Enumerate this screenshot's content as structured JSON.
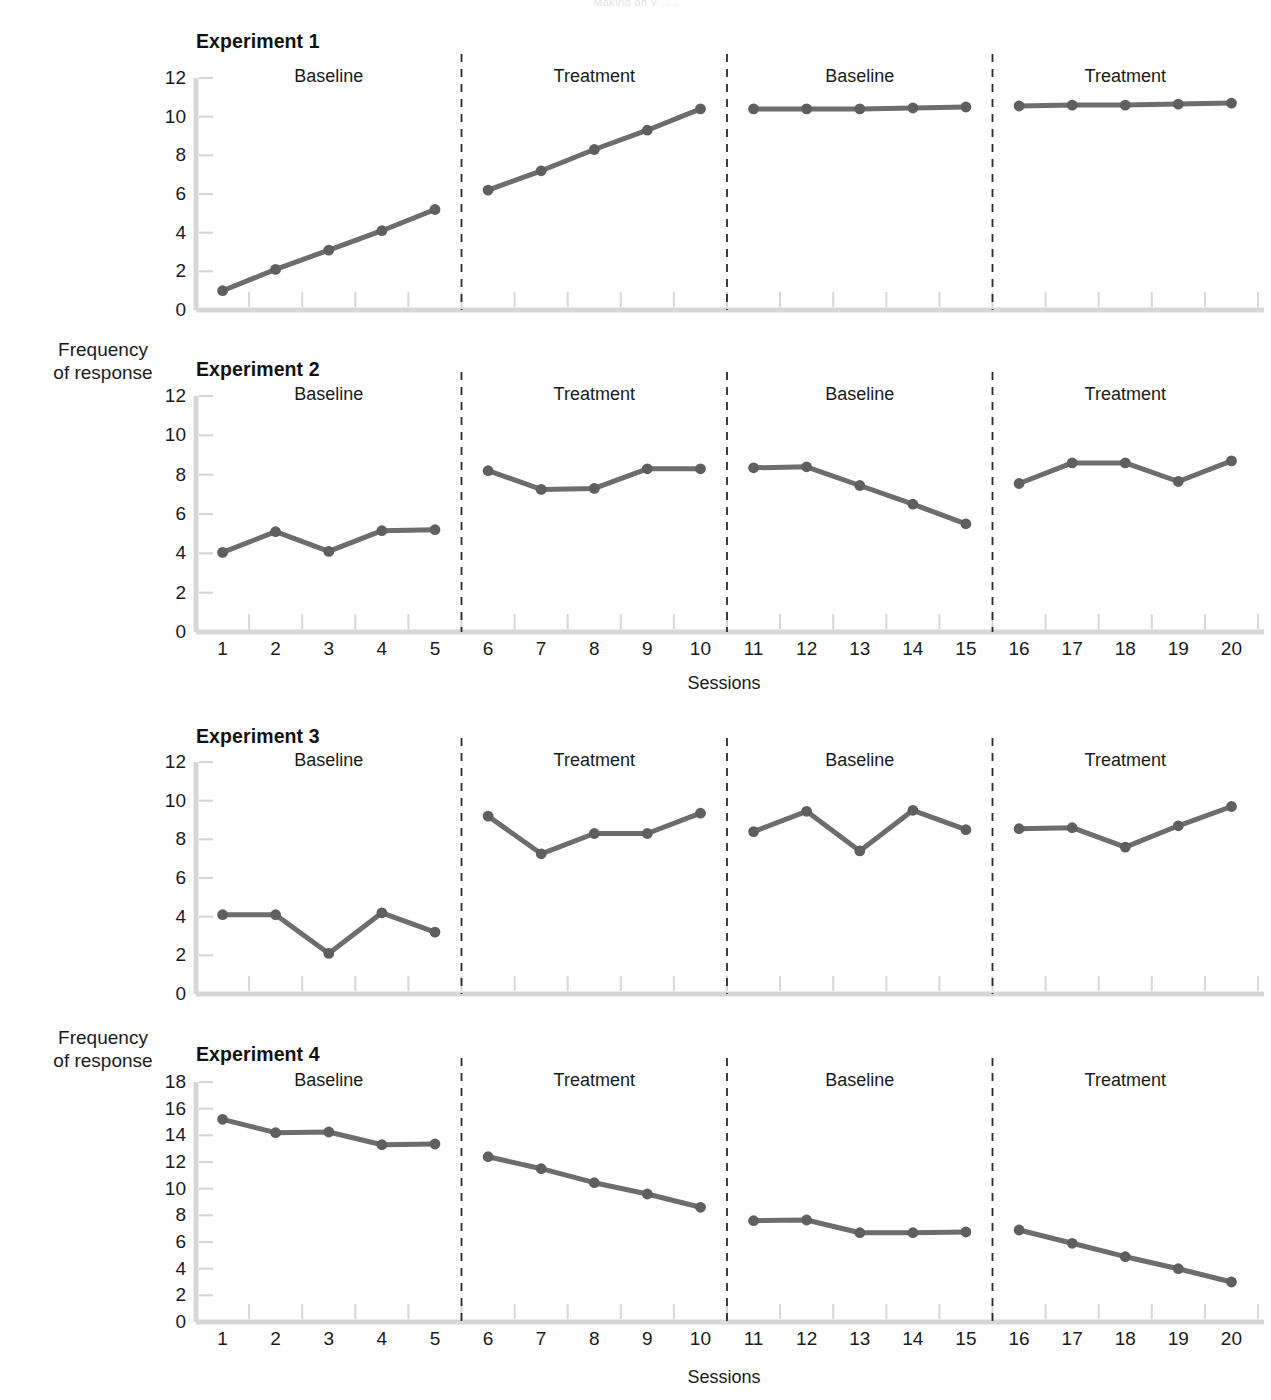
{
  "running_head": "Making an  y  , .  .",
  "axis_titles": {
    "y": "Frequency\nof response",
    "y_line1": "Frequency",
    "y_line2": "of response",
    "x": "Sessions"
  },
  "colors": {
    "series": "#6d6d6d",
    "marker": "#5f5f5f",
    "axis": "#d7d7da",
    "divider": "#2b2b2b",
    "text": "#1a1a1a"
  },
  "phase_labels": [
    "Baseline",
    "Treatment",
    "Baseline",
    "Treatment"
  ],
  "session_ticks": [
    "1",
    "2",
    "3",
    "4",
    "5",
    "6",
    "7",
    "8",
    "9",
    "10",
    "11",
    "12",
    "13",
    "14",
    "15",
    "16",
    "17",
    "18",
    "19",
    "20"
  ],
  "chart_data": [
    {
      "type": "line",
      "title": "Experiment 1",
      "xlabel": "Sessions",
      "ylabel": "Frequency of response",
      "ylim": [
        0,
        12
      ],
      "yticks": [
        0,
        2,
        4,
        6,
        8,
        10,
        12
      ],
      "ytick_labels": [
        "0",
        "2",
        "4",
        "6",
        "8",
        "10",
        "12"
      ],
      "xlim": [
        0.5,
        20.5
      ],
      "x": [
        1,
        2,
        3,
        4,
        5,
        6,
        7,
        8,
        9,
        10,
        11,
        12,
        13,
        14,
        15,
        16,
        17,
        18,
        19,
        20
      ],
      "values": [
        1.0,
        2.1,
        3.1,
        4.1,
        5.2,
        6.2,
        7.2,
        8.3,
        9.3,
        10.4,
        10.4,
        10.4,
        10.4,
        10.45,
        10.5,
        10.55,
        10.6,
        10.6,
        10.65,
        10.7
      ],
      "grid": false,
      "legend": "none",
      "phases": [
        {
          "label": "Baseline",
          "from": 1,
          "to": 5
        },
        {
          "label": "Treatment",
          "from": 6,
          "to": 10
        },
        {
          "label": "Baseline",
          "from": 11,
          "to": 15
        },
        {
          "label": "Treatment",
          "from": 16,
          "to": 20
        }
      ],
      "dividers": [
        5.5,
        10.5,
        15.5
      ],
      "show_xticklabels": false
    },
    {
      "type": "line",
      "title": "Experiment 2",
      "xlabel": "Sessions",
      "ylabel": "Frequency of response",
      "ylim": [
        0,
        12
      ],
      "yticks": [
        0,
        2,
        4,
        6,
        8,
        10,
        12
      ],
      "ytick_labels": [
        "0",
        "2",
        "4",
        "6",
        "8",
        "10",
        "12"
      ],
      "xlim": [
        0.5,
        20.5
      ],
      "x": [
        1,
        2,
        3,
        4,
        5,
        6,
        7,
        8,
        9,
        10,
        11,
        12,
        13,
        14,
        15,
        16,
        17,
        18,
        19,
        20
      ],
      "values": [
        4.05,
        5.1,
        4.1,
        5.15,
        5.2,
        8.2,
        7.25,
        7.3,
        8.3,
        8.3,
        8.35,
        8.4,
        7.45,
        6.5,
        5.5,
        7.55,
        8.6,
        8.6,
        7.65,
        8.7
      ],
      "grid": false,
      "legend": "none",
      "phases": [
        {
          "label": "Baseline",
          "from": 1,
          "to": 5
        },
        {
          "label": "Treatment",
          "from": 6,
          "to": 10
        },
        {
          "label": "Baseline",
          "from": 11,
          "to": 15
        },
        {
          "label": "Treatment",
          "from": 16,
          "to": 20
        }
      ],
      "dividers": [
        5.5,
        10.5,
        15.5
      ],
      "show_xticklabels": true
    },
    {
      "type": "line",
      "title": "Experiment 3",
      "xlabel": "Sessions",
      "ylabel": "Frequency of response",
      "ylim": [
        0,
        12
      ],
      "yticks": [
        0,
        2,
        4,
        6,
        8,
        10,
        12
      ],
      "ytick_labels": [
        "0",
        "2",
        "4",
        "6",
        "8",
        "10",
        "12"
      ],
      "xlim": [
        0.5,
        20.5
      ],
      "x": [
        1,
        2,
        3,
        4,
        5,
        6,
        7,
        8,
        9,
        10,
        11,
        12,
        13,
        14,
        15,
        16,
        17,
        18,
        19,
        20
      ],
      "values": [
        4.1,
        4.1,
        2.1,
        4.2,
        3.2,
        9.2,
        7.25,
        8.3,
        8.3,
        9.35,
        8.4,
        9.45,
        7.4,
        9.5,
        8.5,
        8.55,
        8.6,
        7.6,
        8.7,
        9.7
      ],
      "grid": false,
      "legend": "none",
      "phases": [
        {
          "label": "Baseline",
          "from": 1,
          "to": 5
        },
        {
          "label": "Treatment",
          "from": 6,
          "to": 10
        },
        {
          "label": "Baseline",
          "from": 11,
          "to": 15
        },
        {
          "label": "Treatment",
          "from": 16,
          "to": 20
        }
      ],
      "dividers": [
        5.5,
        10.5,
        15.5
      ],
      "show_xticklabels": false
    },
    {
      "type": "line",
      "title": "Experiment 4",
      "xlabel": "Sessions",
      "ylabel": "Frequency of response",
      "ylim": [
        0,
        18
      ],
      "yticks": [
        0,
        2,
        4,
        6,
        8,
        10,
        12,
        14,
        16,
        18
      ],
      "ytick_labels": [
        "0",
        "2",
        "4",
        "6",
        "8",
        "10",
        "12",
        "14",
        "16",
        "18"
      ],
      "xlim": [
        0.5,
        20.5
      ],
      "x": [
        1,
        2,
        3,
        4,
        5,
        6,
        7,
        8,
        9,
        10,
        11,
        12,
        13,
        14,
        15,
        16,
        17,
        18,
        19,
        20
      ],
      "values": [
        15.2,
        14.2,
        14.25,
        13.3,
        13.35,
        12.4,
        11.5,
        10.45,
        9.6,
        8.6,
        7.6,
        7.65,
        6.7,
        6.7,
        6.75,
        6.9,
        5.9,
        4.9,
        4.0,
        3.0
      ],
      "grid": false,
      "legend": "none",
      "phases": [
        {
          "label": "Baseline",
          "from": 1,
          "to": 5
        },
        {
          "label": "Treatment",
          "from": 6,
          "to": 10
        },
        {
          "label": "Baseline",
          "from": 11,
          "to": 15
        },
        {
          "label": "Treatment",
          "from": 16,
          "to": 20
        }
      ],
      "dividers": [
        5.5,
        10.5,
        15.5
      ],
      "show_xticklabels": true
    }
  ]
}
